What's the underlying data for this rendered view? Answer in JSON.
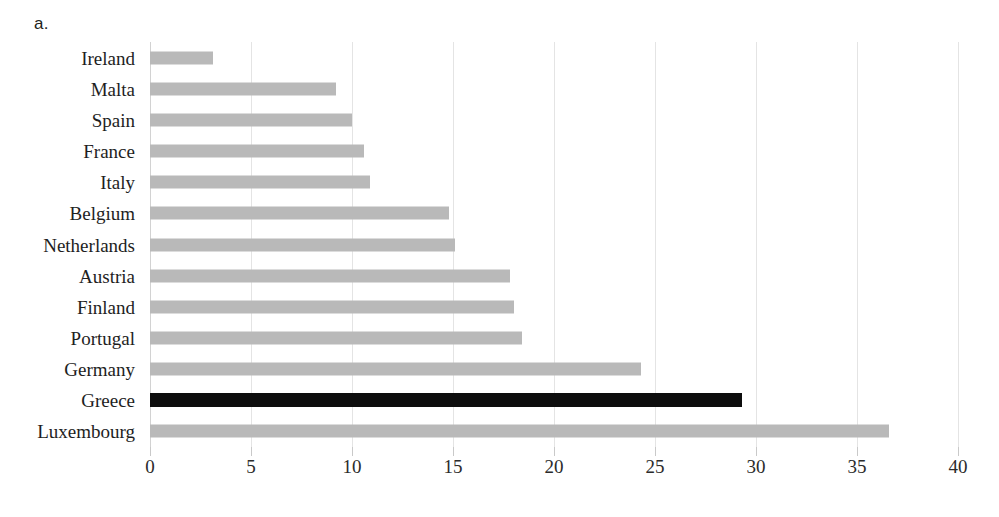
{
  "panel": {
    "label": "a."
  },
  "chart_data": {
    "type": "bar",
    "orientation": "horizontal",
    "title": "",
    "subtitle": "",
    "xlabel": "",
    "ylabel": "",
    "xlim": [
      0,
      40
    ],
    "ylim": null,
    "grid": "vertical-only",
    "legend": "none",
    "categories": [
      "Ireland",
      "Malta",
      "Spain",
      "France",
      "Italy",
      "Belgium",
      "Netherlands",
      "Austria",
      "Finland",
      "Portugal",
      "Germany",
      "Greece",
      "Luxembourg"
    ],
    "values": [
      3.1,
      9.2,
      10.0,
      10.6,
      10.9,
      14.8,
      15.1,
      17.8,
      18.0,
      18.4,
      24.3,
      29.3,
      36.6
    ],
    "xticks": [
      0,
      5,
      10,
      15,
      20,
      25,
      30,
      35,
      40
    ],
    "xtick_labels": [
      "0",
      "5",
      "10",
      "15",
      "20",
      "25",
      "30",
      "35",
      "40"
    ],
    "highlighted_category": "Greece",
    "colors": {
      "bar": "#b9b9b9",
      "bar_highlight": "#0d0d0d",
      "gridline": "#e4e4e4",
      "text": "#1e1e1e",
      "background": "#ffffff"
    }
  }
}
